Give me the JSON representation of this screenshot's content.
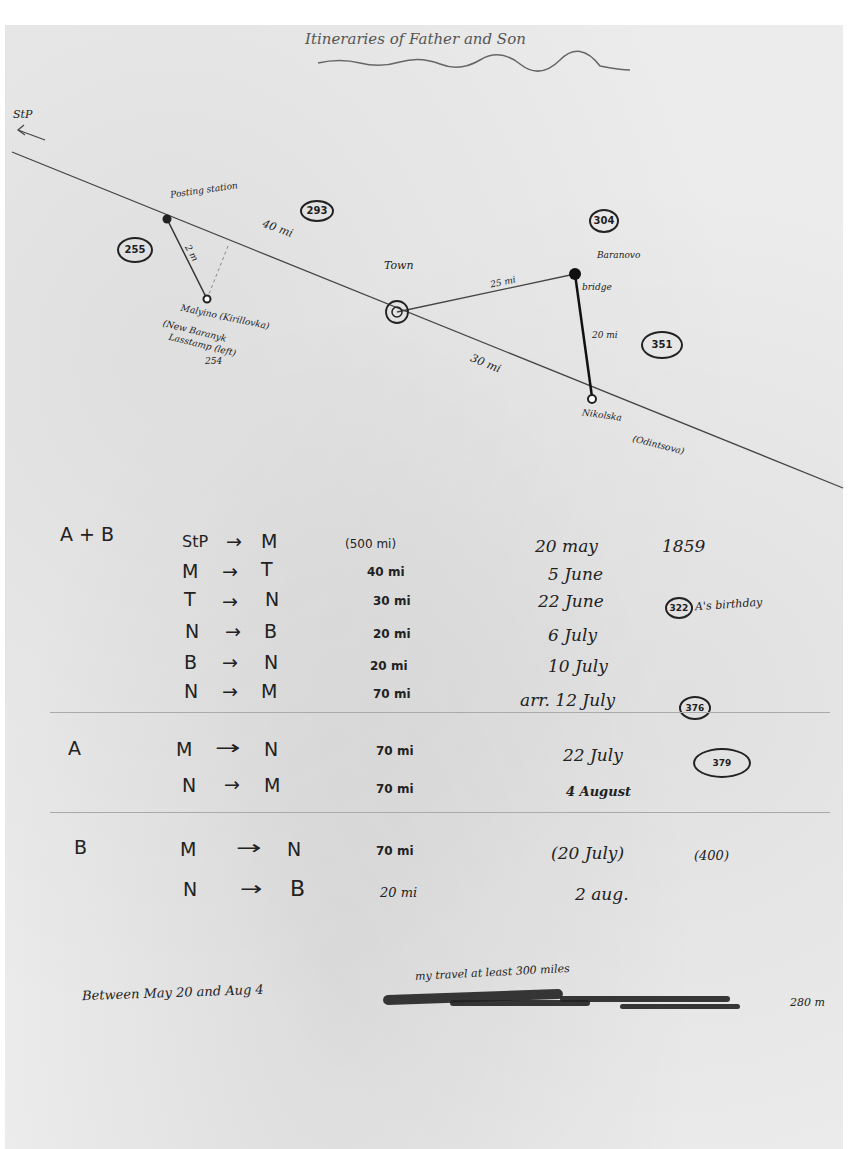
{
  "document": {
    "title": "Itineraries of Father and Son",
    "map": {
      "route_label": "StP",
      "places": {
        "posting_station": "Posting station",
        "malyino": "Malyino (Kirillovka)",
        "malyino_sub1": "(New Baranyk",
        "malyino_sub2": "Lasstamp (left)",
        "malyino_sub3": "254",
        "town": "Town",
        "baranovo": "Baranovo",
        "bridge": "bridge",
        "nikolska": "Nikolska",
        "nikolska_sub": "(Odintsova)"
      },
      "distances": {
        "posting_to_town": "40 mi",
        "posting_to_malyino": "2 m",
        "town_to_baranovo": "25 mi",
        "baranovo_to_nikolska": "20 mi",
        "town_to_nikolska": "30 mi"
      },
      "circled_numbers": {
        "left": "255",
        "top_center": "293",
        "top_right": "304",
        "right": "351"
      }
    },
    "itinerary": {
      "sections": [
        {
          "label": "A + B",
          "rows": [
            {
              "from": "StP",
              "to": "M",
              "distance": "(500 mi)",
              "date": "20 may",
              "extra": "1859",
              "circled": ""
            },
            {
              "from": "M",
              "to": "T",
              "distance": "40 mi",
              "date": "5 June",
              "extra": "",
              "circled": ""
            },
            {
              "from": "T",
              "to": "N",
              "distance": "30 mi",
              "date": "22 June",
              "extra": "A's birthday",
              "circled": "322"
            },
            {
              "from": "N",
              "to": "B",
              "distance": "20 mi",
              "date": "6 July",
              "extra": "",
              "circled": ""
            },
            {
              "from": "B",
              "to": "N",
              "distance": "20 mi",
              "date": "10 July",
              "extra": "",
              "circled": ""
            },
            {
              "from": "N",
              "to": "M",
              "distance": "70 mi",
              "date": "arr. 12 July",
              "extra": "",
              "circled": "376"
            }
          ]
        },
        {
          "label": "A",
          "rows": [
            {
              "from": "M",
              "to": "N",
              "distance": "70 mi",
              "date": "22 July",
              "extra": "",
              "circled": "379"
            },
            {
              "from": "N",
              "to": "M",
              "distance": "70 mi",
              "date": "4 August",
              "extra": "",
              "circled": ""
            }
          ]
        },
        {
          "label": "B",
          "rows": [
            {
              "from": "M",
              "to": "N",
              "distance": "70 mi",
              "date": "(20 July)",
              "extra": "(400)",
              "circled": ""
            },
            {
              "from": "N",
              "to": "B",
              "distance": "20 mi",
              "date": "2 aug.",
              "extra": "",
              "circled": ""
            }
          ]
        }
      ],
      "arrow": "→"
    },
    "footer": {
      "left_note": "Between May 20 and Aug 4",
      "right_note_above": "my travel at least 300 miles",
      "right_note_tail": "280 m"
    }
  }
}
